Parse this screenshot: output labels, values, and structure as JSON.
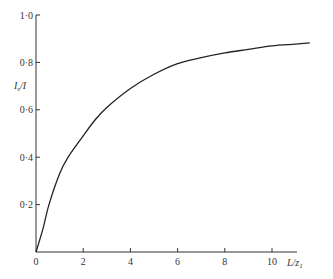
{
  "chart_data": {
    "type": "line",
    "title": "",
    "xlabel": "L/z1",
    "ylabel": "I_s/I",
    "xlim": [
      0,
      11.6
    ],
    "ylim": [
      0,
      1.0
    ],
    "grid": false,
    "legend": null,
    "x_ticks": [
      0,
      2,
      4,
      6,
      8,
      10
    ],
    "x_tick_labels": [
      "0",
      "2",
      "4",
      "6",
      "8",
      "10"
    ],
    "y_ticks": [
      0.2,
      0.4,
      0.6,
      0.8,
      1.0
    ],
    "y_tick_labels": [
      "0·2",
      "0·4",
      "0·6",
      "0·8",
      "1·0"
    ],
    "series": [
      {
        "name": "I_s/I",
        "x": [
          0,
          0.3,
          0.55,
          1.0,
          1.36,
          2.0,
          2.5,
          3.0,
          4.0,
          5.0,
          6.0,
          7.0,
          8.0,
          9.0,
          10.0,
          11.0,
          11.6
        ],
        "y": [
          0,
          0.1,
          0.2,
          0.33,
          0.4,
          0.49,
          0.557,
          0.61,
          0.69,
          0.75,
          0.795,
          0.82,
          0.84,
          0.855,
          0.87,
          0.877,
          0.882
        ]
      }
    ]
  },
  "labels": {
    "x_axis": "L",
    "x_axis_sub": "z",
    "x_axis_sub_index": "1",
    "y_axis_main": "I",
    "y_axis_sub": "s",
    "y_axis_den": "/I"
  }
}
